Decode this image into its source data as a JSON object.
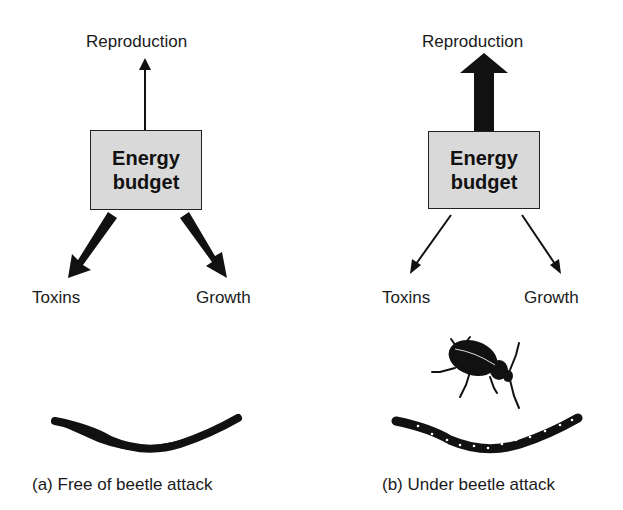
{
  "panels": [
    {
      "id": "a",
      "caption": "(a) Free of beetle attack",
      "box_label_line1": "Energy",
      "box_label_line2": "budget",
      "outputs": {
        "reproduction": {
          "label": "Reproduction",
          "arrow_weight": "thin"
        },
        "toxins": {
          "label": "Toxins",
          "arrow_weight": "thick"
        },
        "growth": {
          "label": "Growth",
          "arrow_weight": "thick"
        }
      },
      "beetle_present": false
    },
    {
      "id": "b",
      "caption": "(b) Under beetle attack",
      "box_label_line1": "Energy",
      "box_label_line2": "budget",
      "outputs": {
        "reproduction": {
          "label": "Reproduction",
          "arrow_weight": "very thick"
        },
        "toxins": {
          "label": "Toxins",
          "arrow_weight": "thin"
        },
        "growth": {
          "label": "Growth",
          "arrow_weight": "thin"
        }
      },
      "beetle_present": true
    }
  ],
  "colors": {
    "box_fill": "#d9d9d9",
    "ink": "#111111",
    "background": "#ffffff"
  }
}
